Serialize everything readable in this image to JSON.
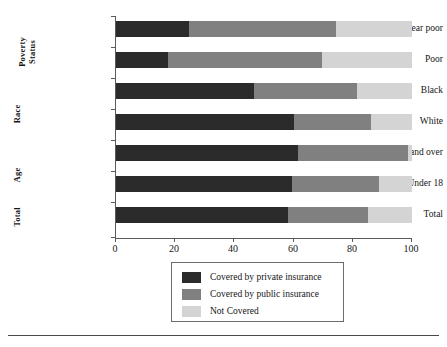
{
  "chart_data": {
    "type": "bar",
    "orientation": "horizontal",
    "stacked": true,
    "stack_mode": "percent",
    "title": "",
    "subtitle": "",
    "xlabel": "",
    "ylabel": "",
    "xlim": [
      0,
      100
    ],
    "xticks": [
      0,
      20,
      40,
      60,
      80,
      100
    ],
    "xtick_labels": [
      "0",
      "20",
      "40",
      "60",
      "80",
      "100"
    ],
    "grid": false,
    "legend_position": "bottom-center",
    "categories": [
      "Near poor",
      "Poor",
      "Black",
      "White",
      "65 and over",
      "Under 18",
      "Total"
    ],
    "group_labels": [
      {
        "text": "Poverty Status",
        "two_line": true,
        "categories": [
          "Near poor",
          "Poor"
        ]
      },
      {
        "text": "Race",
        "two_line": false,
        "categories": [
          "Black",
          "White"
        ]
      },
      {
        "text": "Age",
        "two_line": false,
        "categories": [
          "65 and over",
          "Under 18"
        ]
      },
      {
        "text": "Total",
        "two_line": false,
        "categories": [
          "Total"
        ]
      }
    ],
    "series": [
      {
        "name": "Covered by private insurance",
        "color": "#2b2b2b",
        "values": [
          24.6,
          17.5,
          46.5,
          60.0,
          61.6,
          59.6,
          58.0
        ]
      },
      {
        "name": "Covered by public insurance",
        "color": "#808080",
        "values": [
          49.8,
          52.2,
          35.0,
          26.0,
          37.1,
          29.3,
          27.0
        ]
      },
      {
        "name": "Not Covered",
        "color": "#d4d4d4",
        "values": [
          25.6,
          30.3,
          18.5,
          14.0,
          1.3,
          11.1,
          15.0
        ]
      }
    ],
    "cumulative_boundaries": [
      [
        24.6,
        74.4
      ],
      [
        17.5,
        69.7
      ],
      [
        46.5,
        81.5
      ],
      [
        60.0,
        86.0
      ],
      [
        61.6,
        98.7
      ],
      [
        59.6,
        88.9
      ],
      [
        58.0,
        85.0
      ]
    ]
  },
  "legend": {
    "items": [
      {
        "label": "Covered by private insurance",
        "color": "#2b2b2b"
      },
      {
        "label": "Covered by public insurance",
        "color": "#808080"
      },
      {
        "label": "Not Covered",
        "color": "#d4d4d4"
      }
    ]
  },
  "axis": {
    "x_tick_labels": [
      "0",
      "20",
      "40",
      "60",
      "80",
      "100"
    ]
  },
  "colors": {
    "private": "#2b2b2b",
    "public": "#808080",
    "uncovered": "#d4d4d4",
    "axis": "#5a5a5a",
    "text": "#151515",
    "rule": "#4a4a4a"
  }
}
